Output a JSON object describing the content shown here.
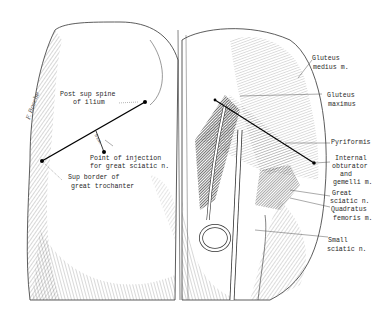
{
  "figure": {
    "left_panel": {
      "signature": "F. Bosche",
      "landmarks": {
        "post_sup_spine": [
          "Post sup spine",
          "of ilium"
        ],
        "injection_point": [
          "Point of injection",
          "for great sciatic n."
        ],
        "great_trochanter": [
          "Sup border of",
          "great trochanter"
        ]
      },
      "measurement": "5 cm."
    },
    "right_panel": {
      "labels": {
        "gluteus_medius": [
          "Gluteus",
          "medius m."
        ],
        "gluteus_maximus": [
          "Gluteus",
          "maximus"
        ],
        "pyriformis": [
          "Pyriformis"
        ],
        "internal_obturator": [
          "Internal",
          "obturator",
          "and",
          "gemelli m."
        ],
        "great_sciatic": [
          "Great",
          "sciatic n."
        ],
        "quadratus_femoris": [
          "Quadratus",
          "femoris m."
        ],
        "small_sciatic": [
          "Small",
          "sciatic n."
        ]
      }
    }
  }
}
